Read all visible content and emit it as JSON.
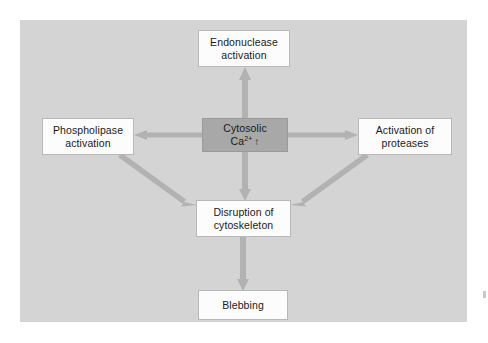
{
  "figure": {
    "panel_background": "#d4d4d4",
    "page_background": "#ffffff",
    "arrow_color": "#b2b2b2",
    "center_node_color": "#a8a8a8",
    "node_box_color": "#fcfcfc"
  },
  "nodes": {
    "endonuclease": {
      "line1": "Endonuclease",
      "line2": "activation"
    },
    "phospholipase": {
      "line1": "Phospholipase",
      "line2": "activation"
    },
    "cytosolic_ca": {
      "line1": "Cytosolic",
      "ion": "Ca",
      "charge": "2+",
      "trend": "↑"
    },
    "proteases": {
      "line1": "Activation of",
      "line2": "proteases"
    },
    "cytoskeleton": {
      "line1": "Disruption of",
      "line2": "cytoskeleton"
    },
    "blebbing": {
      "line1": "Blebbing"
    }
  },
  "arrows": [
    {
      "name": "ca-to-endonuclease",
      "from": "cytosolic_ca",
      "to": "endonuclease",
      "direction": "up"
    },
    {
      "name": "ca-to-phospholipase",
      "from": "cytosolic_ca",
      "to": "phospholipase",
      "direction": "left"
    },
    {
      "name": "ca-to-proteases",
      "from": "cytosolic_ca",
      "to": "proteases",
      "direction": "right"
    },
    {
      "name": "ca-to-cytoskeleton",
      "from": "cytosolic_ca",
      "to": "cytoskeleton",
      "direction": "down"
    },
    {
      "name": "phospholipase-to-cytoskeleton",
      "from": "phospholipase",
      "to": "cytoskeleton",
      "direction": "diagonal-down-right"
    },
    {
      "name": "proteases-to-cytoskeleton",
      "from": "proteases",
      "to": "cytoskeleton",
      "direction": "diagonal-down-left"
    },
    {
      "name": "cytoskeleton-to-blebbing",
      "from": "cytoskeleton",
      "to": "blebbing",
      "direction": "down"
    }
  ]
}
